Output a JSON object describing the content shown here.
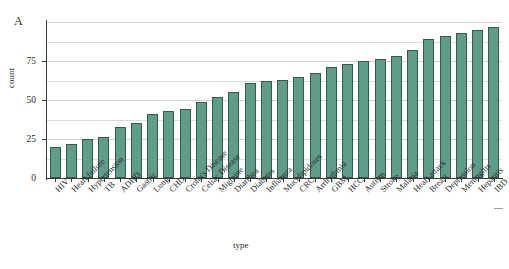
{
  "panel": {
    "label": "A"
  },
  "axes": {
    "ylabel": "count",
    "xlabel": "type",
    "yticks": [
      0,
      25,
      50,
      75
    ],
    "ytick_labels": [
      "0",
      "25",
      "50",
      "75"
    ]
  },
  "chart_data": {
    "type": "bar",
    "title": "A",
    "xlabel": "type",
    "ylabel": "count",
    "ylim": [
      0,
      100
    ],
    "grid": true,
    "gridline_interval": 12.5,
    "legend": null,
    "sorted": "ascending",
    "bar_color": "#5d9d8a",
    "bar_edge_color": "#38574f",
    "categories": [
      "HIV",
      "Heart failure",
      "Hypertension",
      "TB",
      "ADHD",
      "Gastric",
      "Lung",
      "CHD",
      "Crohn's Disease",
      "Celiac Disease",
      "Migraine",
      "Diarrhea",
      "Diabetes",
      "Influenza",
      "Mucolipidoses",
      "CRC",
      "Arrhythmia",
      "GBM",
      "HCC",
      "Autism",
      "Stroke",
      "Malaria",
      "Heart attack",
      "Breast",
      "Depression",
      "Meningitis",
      "Hepatitis",
      "IBD"
    ],
    "values": [
      20,
      22,
      25,
      26,
      33,
      35,
      41,
      43,
      44,
      49,
      52,
      55,
      61,
      62,
      63,
      65,
      67,
      71,
      73,
      75,
      76,
      78,
      82,
      89,
      91,
      93,
      95,
      97
    ]
  }
}
